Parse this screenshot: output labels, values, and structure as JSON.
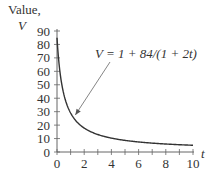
{
  "chart_data": {
    "type": "line",
    "title": "",
    "ylabel_line1": "Value,",
    "ylabel_line2": "V",
    "xlabel": "t",
    "xlim": [
      0,
      10
    ],
    "ylim": [
      0,
      90
    ],
    "x_ticks": [
      0,
      2,
      4,
      6,
      8,
      10
    ],
    "x_tick_labels": [
      "0",
      "2",
      "4",
      "6",
      "8",
      "10"
    ],
    "x_minor_ticks": [
      1,
      3,
      5,
      7,
      9
    ],
    "y_ticks": [
      0,
      10,
      20,
      30,
      40,
      50,
      60,
      70,
      80,
      90
    ],
    "y_tick_labels": [
      "0",
      "10",
      "20",
      "30",
      "40",
      "50",
      "60",
      "70",
      "80",
      "90"
    ],
    "grid": false,
    "series": [
      {
        "name": "V = 1 + 84/(1 + 2t)",
        "formula": "1 + 84/(1 + 2t)",
        "x": [
          0,
          0.25,
          0.5,
          0.75,
          1,
          1.5,
          2,
          3,
          4,
          5,
          6,
          7,
          8,
          9,
          10
        ],
        "values": [
          85,
          57,
          43,
          34.6,
          29,
          22,
          17.8,
          13,
          10.3,
          8.6,
          7.5,
          6.6,
          5.9,
          5.4,
          5
        ]
      }
    ],
    "annotation": {
      "text": "V = 1 + 84/(1 + 2t)",
      "points_to": {
        "x": 1.2,
        "y": 26
      }
    }
  }
}
